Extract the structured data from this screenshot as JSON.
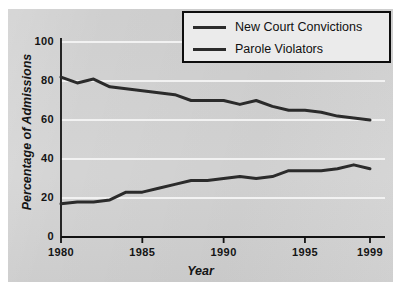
{
  "chart_data": {
    "type": "line",
    "title": "",
    "xlabel": "Year",
    "ylabel": "Percentage of Admissions",
    "x": [
      1980,
      1981,
      1982,
      1983,
      1984,
      1985,
      1986,
      1987,
      1988,
      1989,
      1990,
      1991,
      1992,
      1993,
      1994,
      1995,
      1996,
      1997,
      1998,
      1999
    ],
    "xlim": [
      1980,
      1999
    ],
    "ylim": [
      0,
      100
    ],
    "xticks": [
      "1980",
      "1985",
      "1990",
      "1995",
      "1999"
    ],
    "xtick_values": [
      1980,
      1985,
      1990,
      1995,
      1999
    ],
    "yticks": [
      "0",
      "20",
      "40",
      "60",
      "80",
      "100"
    ],
    "ytick_values": [
      0,
      20,
      40,
      60,
      80,
      100
    ],
    "grid": "horizontal-white",
    "legend_position": "top-right",
    "series": [
      {
        "name": "New Court Convictions",
        "color": "#2b2b2b",
        "values": [
          82,
          79,
          81,
          77,
          76,
          75,
          74,
          73,
          70,
          70,
          70,
          68,
          70,
          67,
          65,
          65,
          64,
          62,
          61,
          60
        ]
      },
      {
        "name": "Parole Violators",
        "color": "#2b2b2b",
        "values": [
          17,
          18,
          18,
          19,
          23,
          23,
          25,
          27,
          29,
          29,
          30,
          31,
          30,
          31,
          34,
          34,
          34,
          35,
          37,
          35
        ]
      }
    ]
  },
  "colors": {
    "panel_background": "#d2d2d2",
    "page_background": "#ffffff",
    "gridline": "#f2f2f2",
    "axis": "#121212",
    "line": "#2b2b2b",
    "legend_background": "#ebebeb",
    "legend_border": "#0d0d0d",
    "text": "#141414"
  },
  "legend": {
    "items": [
      {
        "label": "New Court Convictions"
      },
      {
        "label": "Parole Violators"
      }
    ]
  },
  "axes": {
    "y_title": "Percentage of Admissions",
    "x_title": "Year"
  }
}
